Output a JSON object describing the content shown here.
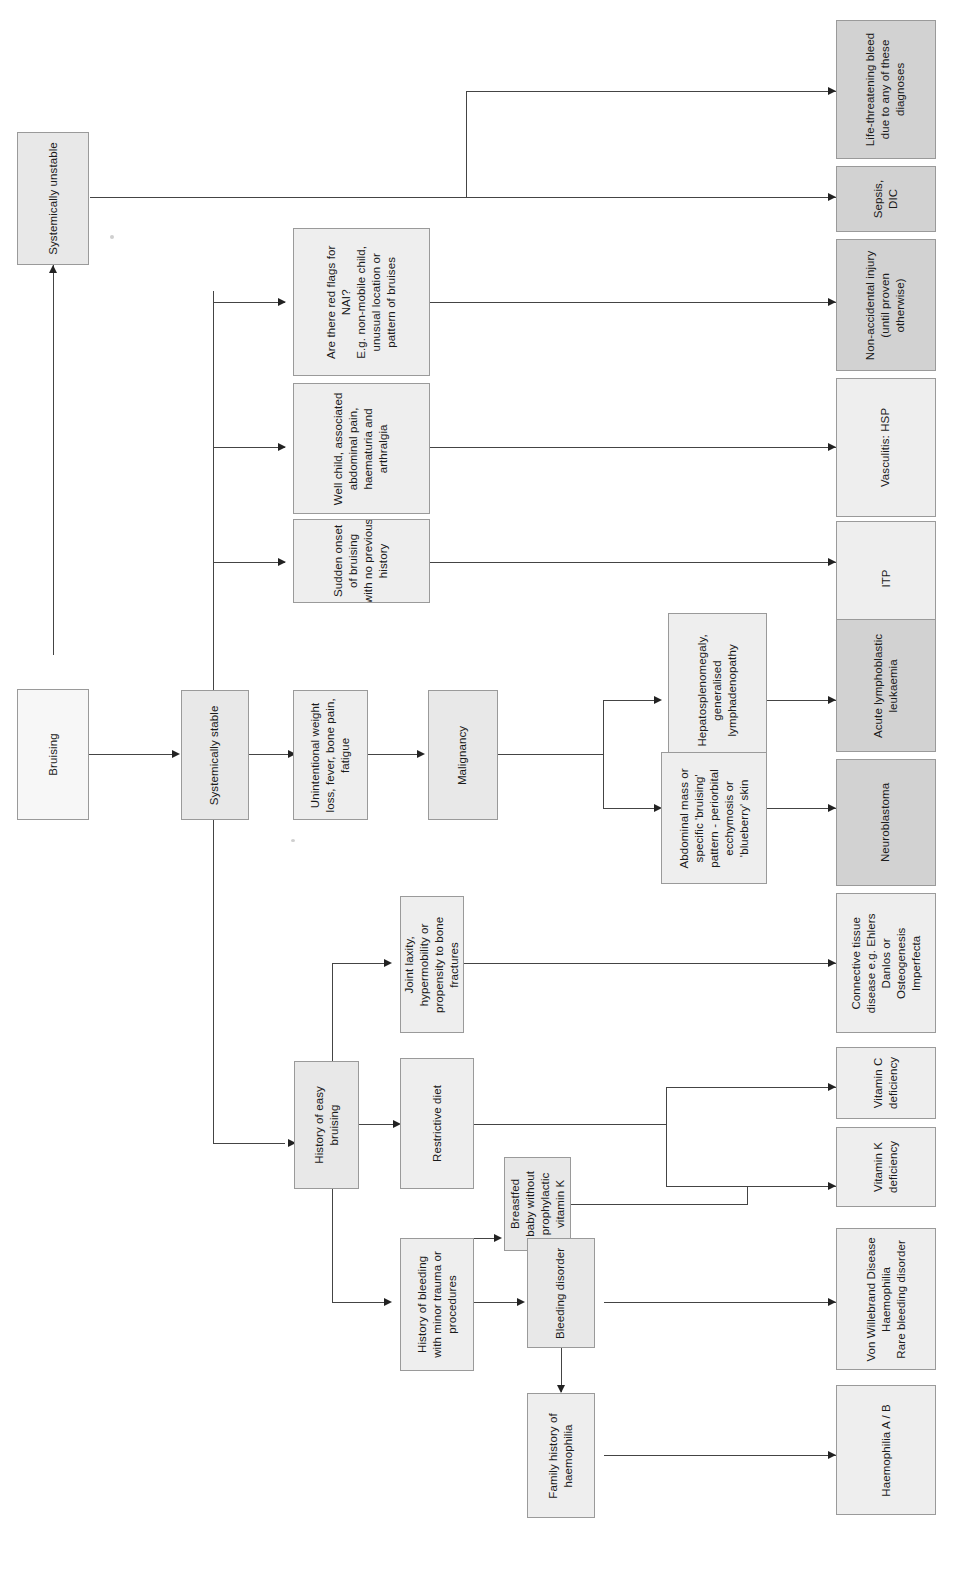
{
  "diagram": {
    "orientation": "rotated-90",
    "colors": {
      "box_light": "#eeeeee",
      "box_dark": "#d2d2d2",
      "box_white": "#f7f7f7",
      "border": "#9a9a9a",
      "connector": "#444444",
      "text": "#1a1a1a"
    }
  },
  "nodes": {
    "root": "Bruising",
    "unstable": "Systemically unstable",
    "stable": "Systemically stable",
    "nai_flags": "Are there red flags for\nNAI?\nE.g. non-mobile child,\nunusual location or\npattern of bruises",
    "hsp_features": "Well child, associated\nabdominal pain,\nhaematuria and\narthralgia",
    "itp_features": "Sudden onset\nof bruising\nwith no previous\nhistory",
    "malignancy_features": "Unintentional weight\nloss, fever, bone pain,\nfatigue",
    "malignancy": "Malignancy",
    "all_features": "Hepatosplenomegaly,\ngeneralised\nlymphadenopathy",
    "neuroblastoma_features": "Abdominal mass or\nspecific 'bruising'\npattern - periorbital\necchymosis or\n'blueberry' skin",
    "easy_bruising": "History of easy\nbruising",
    "joint_laxity": "Joint laxity,\nhypermobility or\npropensity to bone\nfractures",
    "restrictive_diet": "Restrictive diet",
    "breastfed": "Breastfed\nbaby without\nprophylactic\nvitamin K",
    "bleeding_history": "History of bleeding\nwith minor trauma or\nprocedures",
    "bleeding_disorder": "Bleeding disorder",
    "family_history": "Family history of\nhaemophilia"
  },
  "outcomes": {
    "life_threatening": "Life-threatening bleed\ndue to any of these\ndiagnoses",
    "sepsis_dic": "Sepsis,\nDIC",
    "nai": "Non-accidental injury\n(until proven\notherwise)",
    "vasculitis": "Vasculitis: HSP",
    "itp": "ITP",
    "all": "Acute lymphoblastic\nleukaemia",
    "neuroblastoma": "Neuroblastoma",
    "connective_tissue": "Connective tissue\ndisease e.g. Ehlers\nDanlos or\nOsteogenesis\nImperfecta",
    "vitamin_c": "Vitamin C\ndeficiency",
    "vitamin_k": "Vitamin K\ndeficiency",
    "bleeding_disorders": "Von Willebrand Disease\nHaemophilia\nRare bleeding disorder",
    "haemophilia": "Haemophilia A / B"
  }
}
